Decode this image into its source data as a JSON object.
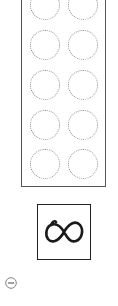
{
  "tray": {
    "rows": 5,
    "columns": 2,
    "slots": [
      {
        "row": 0,
        "col": 0
      },
      {
        "row": 0,
        "col": 1
      },
      {
        "row": 1,
        "col": 0
      },
      {
        "row": 1,
        "col": 1
      },
      {
        "row": 2,
        "col": 0
      },
      {
        "row": 2,
        "col": 1
      },
      {
        "row": 3,
        "col": 0
      },
      {
        "row": 3,
        "col": 1
      },
      {
        "row": 4,
        "col": 0
      },
      {
        "row": 4,
        "col": 1
      }
    ],
    "slot_border_color": "#8a8a8a",
    "border_color": "#555555"
  },
  "infinity_button": {
    "icon": "infinity-icon",
    "color": "#222222"
  },
  "zoom_out_button": {
    "icon": "minus-circle-icon",
    "color": "#777777"
  }
}
